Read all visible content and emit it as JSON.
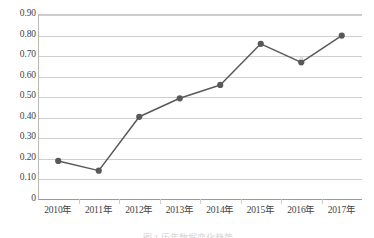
{
  "chart_data": {
    "type": "line",
    "title": "",
    "subtitle": "",
    "xlabel": "",
    "ylabel": "",
    "categories": [
      "2010年",
      "2011年",
      "2012年",
      "2013年",
      "2014年",
      "2015年",
      "2016年",
      "2017年"
    ],
    "values": [
      0.185,
      0.138,
      0.4,
      0.49,
      0.555,
      0.755,
      0.665,
      0.795
    ],
    "series": [
      {
        "name": "",
        "values": [
          0.185,
          0.138,
          0.4,
          0.49,
          0.555,
          0.755,
          0.665,
          0.795
        ]
      }
    ],
    "ylim": [
      0,
      0.9
    ],
    "ytick_step": 0.1,
    "ytick_labels": [
      "0.90",
      "0.80",
      "0.70",
      "0.60",
      "0.50",
      "0.40",
      "0.30",
      "0.20",
      "0.10",
      "0"
    ],
    "ytick_values": [
      0.9,
      0.8,
      0.7,
      0.6,
      0.5,
      0.4,
      0.3,
      0.2,
      0.1,
      0
    ],
    "xtick_labels": [
      "2010年",
      "2011年",
      "2012年",
      "2013年",
      "2014年",
      "2015年",
      "2016年",
      "2017年"
    ],
    "grid": "horizontal",
    "legend": "none",
    "marker": "circle",
    "colors": {
      "line": "#595959",
      "marker": "#595959",
      "gridline": "#cfcfcf",
      "axis": "#9a9a9a",
      "background": "#ffffff",
      "text": "#434343"
    }
  },
  "figure": {
    "clipped_caption": "图 1  历年数据变化趋势"
  }
}
